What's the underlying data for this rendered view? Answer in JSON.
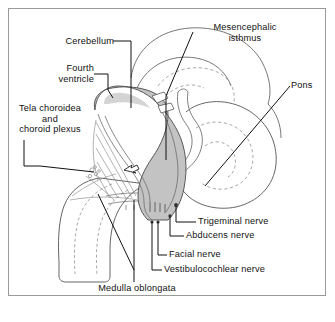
{
  "figure": {
    "background_color": "#ffffff",
    "frame_color": "#9a9a9a",
    "ink_color": "#111111",
    "shade_fill": "#c3c3c3",
    "shade_fill_light": "#d7d7d7",
    "outline_color": "#4a4a4a",
    "dashed_color": "#8c8c8c"
  },
  "labels": {
    "cerebellum": "Cerebellum",
    "fourth_ventricle": "Fourth\nventricle",
    "tela_choroidea": "Tela choroidea\nand\nchoroid plexus",
    "mesencephalic_isthmus": "Mesencephalic\nisthmus",
    "pons": "Pons",
    "trigeminal_nerve": "Trigeminal nerve",
    "abducens_nerve": "Abducens nerve",
    "facial_nerve": "Facial nerve",
    "vestibulocochlear_nerve": "Vestibulocochlear nerve",
    "medulla_oblongata": "Medulla oblongata"
  },
  "caption": {
    "line": "                                                                    "
  },
  "annotations": {
    "flow_arrow": "csf-flow-arrow"
  }
}
